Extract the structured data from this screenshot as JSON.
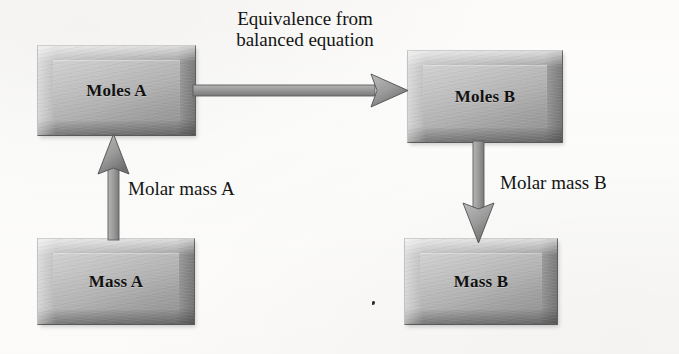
{
  "diagram": {
    "background_color": "#fdfdfc",
    "box_fill_color": "#b2b2b2",
    "arrow_color": "#8f8f8f",
    "text_color": "#141414",
    "boxes": [
      {
        "id": "moles-a",
        "label": "Moles A",
        "x": 37,
        "y": 45,
        "width": 159,
        "height": 91
      },
      {
        "id": "moles-b",
        "label": "Moles B",
        "x": 407,
        "y": 50,
        "width": 156,
        "height": 93
      },
      {
        "id": "mass-a",
        "label": "Mass A",
        "x": 37,
        "y": 238,
        "width": 158,
        "height": 87
      },
      {
        "id": "mass-b",
        "label": "Mass B",
        "x": 404,
        "y": 238,
        "width": 154,
        "height": 87
      }
    ],
    "arrows": [
      {
        "id": "moles-a-to-moles-b",
        "from": "moles-a",
        "to": "moles-b",
        "direction": "right",
        "label": "Equivalence from balanced equation"
      },
      {
        "id": "mass-a-to-moles-a",
        "from": "mass-a",
        "to": "moles-a",
        "direction": "up",
        "label": "Molar mass A"
      },
      {
        "id": "moles-b-to-mass-b",
        "from": "moles-b",
        "to": "mass-b",
        "direction": "down",
        "label": "Molar mass B"
      }
    ],
    "labels": {
      "equivalence_line_1": "Equivalence from",
      "equivalence_line_2": "balanced equation",
      "molar_mass_a": "Molar mass A",
      "molar_mass_b": "Molar mass B"
    }
  }
}
